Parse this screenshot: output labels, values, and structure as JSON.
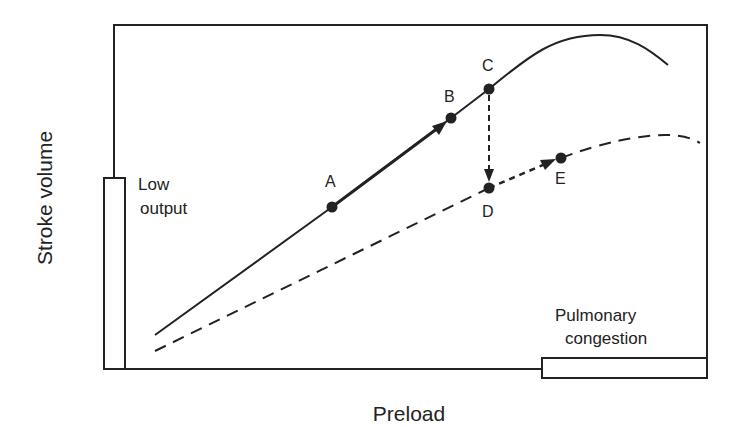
{
  "axes": {
    "ylabel": "Stroke volume",
    "xlabel": "Preload"
  },
  "regions": {
    "low_output": "Low\noutput",
    "low_output_line1": "Low",
    "low_output_line2": "output",
    "pulmonary_congestion_line1": "Pulmonary",
    "pulmonary_congestion_line2": "congestion"
  },
  "points": {
    "A": "A",
    "B": "B",
    "C": "C",
    "D": "D",
    "E": "E"
  },
  "curves": [
    {
      "name": "normal-function",
      "style": "solid"
    },
    {
      "name": "depressed-function",
      "style": "dashed"
    }
  ],
  "colors": {
    "ink": "#222222",
    "background": "#ffffff"
  }
}
